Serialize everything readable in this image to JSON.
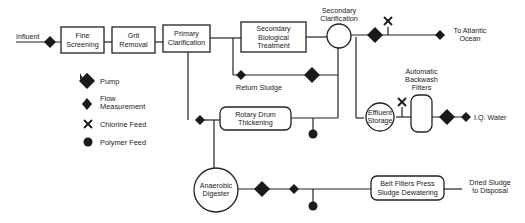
{
  "nodes": {
    "influent": "Influent",
    "fine_screening": [
      "Fine",
      "Screening"
    ],
    "grit_removal": [
      "Grit",
      "Removal"
    ],
    "primary_clarification": [
      "Primary",
      "Clarification"
    ],
    "secondary_bio": [
      "Secondary",
      "Biological",
      "Treatment"
    ],
    "secondary_clarification": [
      "Secondary",
      "Clarification"
    ],
    "to_ocean": [
      "To Atlantic",
      "Ocean"
    ],
    "return_sludge": "Return Sludge",
    "rotary_drum": [
      "Rotary Drum",
      "Thickening"
    ],
    "effluent_storage": [
      "Effluent",
      "Storage"
    ],
    "backwash_filters": [
      "Automatic",
      "Backwash",
      "Filters"
    ],
    "iq_water": "I.Q. Water",
    "anaerobic_digester": [
      "Anaerobic",
      "Digester"
    ],
    "belt_filter": [
      "Belt Filters Press",
      "Sludge Dewatering"
    ],
    "dried_sludge": [
      "Dried Sludge",
      "to Disposal"
    ]
  },
  "legend": [
    {
      "icon": "pump-icon",
      "label": "Pump"
    },
    {
      "icon": "flow-measurement-icon",
      "label": [
        "Flow",
        "Measurement"
      ]
    },
    {
      "icon": "chlorine-feed-icon",
      "label": "Chlorine Feed"
    },
    {
      "icon": "polymer-feed-icon",
      "label": "Polymer Feed"
    }
  ]
}
